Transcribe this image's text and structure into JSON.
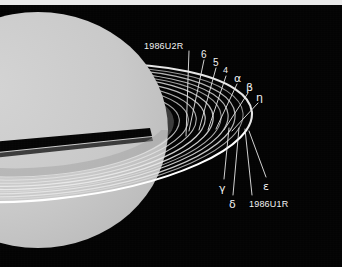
{
  "figure": {
    "background_color": "#030303",
    "top_strip_color": "#e9e9e9",
    "planet_color": "#c8c8c8",
    "ring_color": "#f0f0f0",
    "label_color": "#f2f2f2",
    "leader_line_color": "#e8e8e8",
    "width": 342,
    "height": 267
  },
  "planet": {
    "name": "planet-disk",
    "center_x": 38,
    "center_y": 130,
    "radius_x": 130,
    "radius_y": 118,
    "fill": "#c8c8c8",
    "shadow_band_color": "#050505"
  },
  "labels": [
    {
      "id": "ring-1986U2R",
      "text": "1986U2R",
      "kind": "code",
      "x": 144,
      "y": 42,
      "font_size": 9
    },
    {
      "id": "ring-6",
      "text": "6",
      "kind": "num",
      "x": 201,
      "y": 50,
      "font_size": 10
    },
    {
      "id": "ring-5",
      "text": "5",
      "kind": "num",
      "x": 213,
      "y": 58,
      "font_size": 10
    },
    {
      "id": "ring-4",
      "text": "4",
      "kind": "num",
      "x": 223,
      "y": 66,
      "font_size": 9
    },
    {
      "id": "ring-alpha",
      "text": "α",
      "kind": "greek",
      "x": 234,
      "y": 73,
      "font_size": 11
    },
    {
      "id": "ring-beta",
      "text": "β",
      "kind": "greek",
      "x": 246,
      "y": 82,
      "font_size": 11
    },
    {
      "id": "ring-eta",
      "text": "η",
      "kind": "greek",
      "x": 256,
      "y": 92,
      "font_size": 11
    },
    {
      "id": "ring-gamma",
      "text": "γ",
      "kind": "greek",
      "x": 219,
      "y": 183,
      "font_size": 11
    },
    {
      "id": "ring-delta",
      "text": "δ",
      "kind": "greek",
      "x": 229,
      "y": 199,
      "font_size": 11
    },
    {
      "id": "ring-1986U1R",
      "text": "1986U1R",
      "kind": "code",
      "x": 249,
      "y": 200,
      "font_size": 9
    },
    {
      "id": "ring-epsilon",
      "text": "ε",
      "kind": "greek",
      "x": 263,
      "y": 181,
      "font_size": 11
    }
  ],
  "leader_lines": [
    {
      "id": "leader-1986U2R",
      "x1": 189,
      "y1": 51,
      "x2": 186,
      "y2": 136
    },
    {
      "id": "leader-6",
      "x1": 204,
      "y1": 60,
      "x2": 189,
      "y2": 131
    },
    {
      "id": "leader-5",
      "x1": 216,
      "y1": 68,
      "x2": 199,
      "y2": 130
    },
    {
      "id": "leader-4",
      "x1": 226,
      "y1": 76,
      "x2": 208,
      "y2": 130
    },
    {
      "id": "leader-alpha",
      "x1": 237,
      "y1": 84,
      "x2": 216,
      "y2": 129
    },
    {
      "id": "leader-beta",
      "x1": 248,
      "y1": 93,
      "x2": 224,
      "y2": 130
    },
    {
      "id": "leader-eta",
      "x1": 258,
      "y1": 103,
      "x2": 232,
      "y2": 131
    },
    {
      "id": "leader-gamma",
      "x1": 224,
      "y1": 179,
      "x2": 229,
      "y2": 128
    },
    {
      "id": "leader-delta",
      "x1": 233,
      "y1": 195,
      "x2": 239,
      "y2": 128
    },
    {
      "id": "leader-1986U1R",
      "x1": 252,
      "y1": 195,
      "x2": 245,
      "y2": 129
    },
    {
      "id": "leader-epsilon",
      "x1": 266,
      "y1": 177,
      "x2": 249,
      "y2": 131
    }
  ],
  "rings": [
    {
      "id": "ring-band-1986U2R",
      "label": "1986U2R",
      "rx": 120,
      "ry": 38,
      "width": 9.0,
      "opacity": 0.42,
      "color": "#9a9a9a"
    },
    {
      "id": "ring-ellipse-6",
      "label": "6",
      "rx": 130,
      "ry": 42,
      "width": 1.1,
      "opacity": 0.8,
      "color": "#e2e2e2"
    },
    {
      "id": "ring-ellipse-5",
      "label": "5",
      "rx": 139,
      "ry": 45,
      "width": 1.1,
      "opacity": 0.82,
      "color": "#e4e4e4"
    },
    {
      "id": "ring-ellipse-4",
      "label": "4",
      "rx": 147,
      "ry": 48,
      "width": 1.1,
      "opacity": 0.84,
      "color": "#e6e6e6"
    },
    {
      "id": "ring-ellipse-alpha",
      "label": "α",
      "rx": 156,
      "ry": 51,
      "width": 1.3,
      "opacity": 0.88,
      "color": "#ececec"
    },
    {
      "id": "ring-ellipse-beta",
      "label": "β",
      "rx": 164,
      "ry": 54,
      "width": 1.3,
      "opacity": 0.88,
      "color": "#ececec"
    },
    {
      "id": "ring-ellipse-eta",
      "label": "η",
      "rx": 172,
      "ry": 56,
      "width": 1.0,
      "opacity": 0.78,
      "color": "#dedede"
    },
    {
      "id": "ring-ellipse-gamma",
      "label": "γ",
      "rx": 179,
      "ry": 58,
      "width": 1.2,
      "opacity": 0.86,
      "color": "#e8e8e8"
    },
    {
      "id": "ring-ellipse-delta",
      "label": "δ",
      "rx": 186,
      "ry": 61,
      "width": 1.2,
      "opacity": 0.86,
      "color": "#e8e8e8"
    },
    {
      "id": "ring-ellipse-1986U1R",
      "label": "1986U1R",
      "rx": 194,
      "ry": 63,
      "width": 1.0,
      "opacity": 0.76,
      "color": "#dcdcdc"
    },
    {
      "id": "ring-ellipse-epsilon",
      "label": "ε",
      "rx": 203,
      "ry": 66,
      "width": 2.1,
      "opacity": 1.0,
      "color": "#ffffff"
    }
  ]
}
